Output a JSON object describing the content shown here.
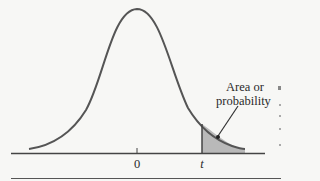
{
  "figure": {
    "type": "t-distribution right-tail diagram",
    "annotation": {
      "line1": "Area or",
      "line2": "probability"
    },
    "x_ticks": [
      {
        "label": "0"
      },
      {
        "label": "t"
      }
    ],
    "colors": {
      "curve": "#555555",
      "shade": "#b9b9b9",
      "axis": "#444444",
      "background": "#f7f7f5"
    }
  }
}
